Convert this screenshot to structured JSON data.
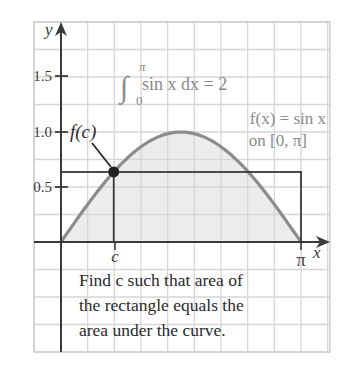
{
  "chart_data": {
    "type": "area",
    "title": "",
    "xlabel": "x",
    "ylabel": "y",
    "xlim": [
      -0.35,
      3.5
    ],
    "ylim": [
      -0.45,
      1.95
    ],
    "grid": true,
    "x_tick_labels": [
      "c",
      "π"
    ],
    "x_ticks": [
      0.69,
      3.14159
    ],
    "y_tick_labels": [
      "0.5",
      "1.0",
      "1.5"
    ],
    "y_ticks": [
      0.5,
      1.0,
      1.5
    ],
    "series": [
      {
        "name": "f(x) = sin x",
        "type": "line+area",
        "x": [
          0,
          0.3927,
          0.7854,
          1.1781,
          1.5708,
          1.9635,
          2.3562,
          2.7489,
          3.14159
        ],
        "values": [
          0,
          0.383,
          0.707,
          0.924,
          1.0,
          0.924,
          0.707,
          0.383,
          0
        ]
      },
      {
        "name": "rectangle",
        "type": "rect",
        "x": [
          0,
          3.14159
        ],
        "height": 0.6366
      },
      {
        "name": "point (c, f(c))",
        "type": "point",
        "x": 0.6901,
        "y": 0.6366
      }
    ],
    "annotations": [
      "∫₀^π sin x dx = 2",
      "f(x) = sin x on [0, π]",
      "f(c)",
      "Find c such that area of the rectangle equals the area under the curve."
    ]
  },
  "axes": {
    "x_label": "x",
    "y_label": "y",
    "y_ticks": [
      "1.5",
      "1.0",
      "0.5"
    ],
    "x_tick_c": "c",
    "x_tick_pi": "π"
  },
  "labels": {
    "fc": "f(c)",
    "integral_upper": "π",
    "integral_lower": "0",
    "integral_body": "sin x dx = 2",
    "func_line1": "f(x) = sin x",
    "func_line2": "on [0, π]",
    "caption_line1": "Find c such that area of",
    "caption_line2": "the rectangle equals the",
    "caption_line3": "area under the curve."
  },
  "colors": {
    "grid": "#d4d4d4",
    "axis": "#3a3a3a",
    "curve": "#8c8c8c",
    "fill": "#ececec",
    "rect": "#3a3a3a",
    "point": "#222222",
    "annotation_grey": "#8a8a8a"
  }
}
